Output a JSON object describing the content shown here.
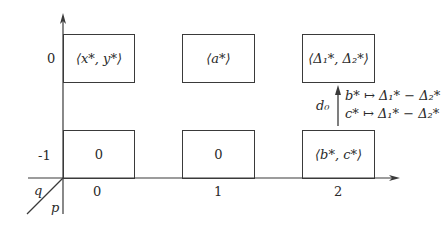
{
  "diagram": {
    "type": "spectral-sequence-page",
    "axes": {
      "horizontal_labels": [
        "0",
        "1",
        "2"
      ],
      "vertical_labels": [
        "0",
        "-1"
      ],
      "corner_labels": {
        "q": "q",
        "p": "p"
      }
    },
    "cells": {
      "r0c0": "⟨x*, y*⟩",
      "r0c1": "⟨a*⟩",
      "r0c2": "⟨Δ₁*, Δ₂*⟩",
      "r1c0": "0",
      "r1c1": "0",
      "r1c2": "⟨b*, c*⟩"
    },
    "differential": {
      "name": "d₀",
      "maps": [
        "b* ↦ Δ₁* − Δ₂*",
        "c* ↦ Δ₁* − Δ₂*"
      ]
    },
    "colors": {
      "line": "#3a3a3a",
      "text": "#2a2a2a",
      "background": "#ffffff"
    }
  }
}
